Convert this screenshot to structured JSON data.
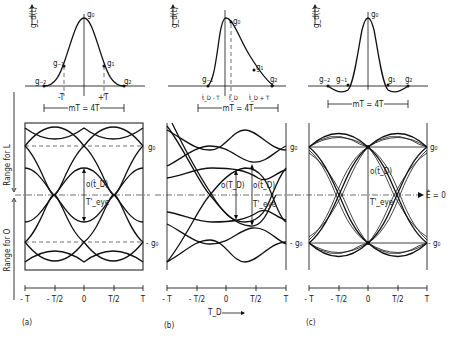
{
  "figure": {
    "panels": [
      {
        "id": "a",
        "caption": "(a)",
        "pulse": {
          "y_label": "g_d(t)",
          "peak_label": "g₀",
          "samples": [
            "g₋₂",
            "g₋₁",
            "g₁",
            "g₂"
          ],
          "tick_labels": [
            "-T",
            "+T"
          ],
          "span_label": "mT = 4T"
        },
        "eye": {
          "level_high": "g₀",
          "level_low": "- g₀",
          "opening_label": "o(t̂_D)",
          "eye_width_label": "T'_eye",
          "x_ticks": [
            "- T",
            "- T/2",
            "0",
            "T/2",
            "T"
          ]
        }
      },
      {
        "id": "b",
        "caption": "(b)",
        "pulse": {
          "y_label": "g_d(t)",
          "peak_label": "g₀",
          "samples": [
            "g₋₁",
            "g₁",
            "g₂"
          ],
          "tick_labels": [
            "t̂_D - T",
            "t̂_D",
            "t̂_D + T"
          ],
          "span_label": "mT = 4T"
        },
        "eye": {
          "level_high": "g₀",
          "level_low": "- g₀",
          "opening_label_1": "o(T_D)",
          "opening_label_2": "o(t̂_D)",
          "eye_width_label": "T'_eye",
          "x_ticks": [
            "- T",
            "- T/2",
            "0",
            "T/2",
            "T"
          ],
          "x_axis_label": "T_D"
        }
      },
      {
        "id": "c",
        "caption": "(c)",
        "pulse": {
          "y_label": "g_d(t)",
          "peak_label": "g₀",
          "samples": [
            "g₋₂",
            "g₋₁",
            "g₁",
            "g₂"
          ],
          "span_label": "mT = 4T"
        },
        "eye": {
          "level_high": "g₀",
          "level_low": "- g₀",
          "opening_label": "o(t̂_D)",
          "eye_width_label": "T'_eye",
          "threshold_label": "Ê = 0",
          "x_ticks": [
            "- T",
            "- T/2",
            "0",
            "T/2",
            "T"
          ]
        }
      }
    ],
    "left_axis": {
      "range_L": "Range for L",
      "range_O": "Range for O"
    }
  }
}
